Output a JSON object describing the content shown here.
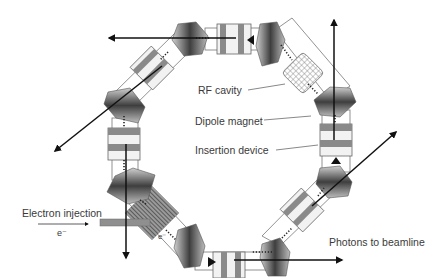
{
  "diagram": {
    "labels": {
      "rf_cavity": "RF cavity",
      "dipole_magnet": "Dipole magnet",
      "insertion_device": "Insertion device",
      "electron_injection": "Electron injection",
      "electron_symbol": "e⁻",
      "electron_symbol_ring": "e⁻",
      "photons": "Photons to beamline"
    },
    "colors": {
      "magnet_dark": "#3c3c3c",
      "magnet_light": "#d8d8d8",
      "id_band": "#8a8a8a",
      "id_light": "#f2f2f2",
      "outline": "#555555",
      "arrow": "#111111",
      "label_text": "#3a3a3a"
    },
    "components": {
      "dipole_magnets": 8,
      "insertion_devices": 6,
      "rf_cavities": 1,
      "injection_septa": 1
    }
  }
}
